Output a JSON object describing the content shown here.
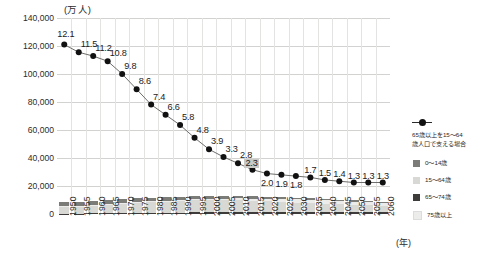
{
  "axis": {
    "unit_caption": "(万人)",
    "x_unit": "(年)",
    "y_ticks": [
      "140,000",
      "120,000",
      "100,000",
      "80,000",
      "60,000",
      "40,000",
      "20,000",
      "0"
    ]
  },
  "legend": {
    "series_label_line1": "65歳以上を15〜64",
    "series_label_line2": "歳人口で支える場合",
    "categories": [
      {
        "key": "c0014",
        "label": "0〜14歳",
        "color": "#7b7b78"
      },
      {
        "key": "c1564",
        "label": "15〜64歳",
        "color": "#d8d8d4"
      },
      {
        "key": "c6574",
        "label": "65〜74歳",
        "color": "#3d3c3a"
      },
      {
        "key": "c75up",
        "label": "75歳以上",
        "color": "#ececea"
      }
    ]
  },
  "chart_data": {
    "type": "bar",
    "title": "",
    "subtitle": "",
    "xlabel": "(年)",
    "ylabel": "(万人)",
    "ylim": [
      0,
      140000
    ],
    "y_ticks": [
      0,
      20000,
      40000,
      60000,
      80000,
      100000,
      120000,
      140000
    ],
    "grid": true,
    "legend_position": "right",
    "categories": [
      "1950",
      "1955",
      "1960",
      "1965",
      "1970",
      "1975",
      "1980",
      "1985",
      "1990",
      "1995",
      "2000",
      "2005",
      "2010",
      "2015",
      "2020",
      "2025",
      "2030",
      "2035",
      "2040",
      "2045",
      "2050",
      "2055",
      "2060"
    ],
    "series": [
      {
        "name": "65〜74歳",
        "color": "#3d3c3a",
        "values": [
          310,
          340,
          380,
          430,
          520,
          590,
          700,
          780,
          890,
          1110,
          1300,
          1410,
          1530,
          1750,
          1740,
          1480,
          1430,
          1520,
          1680,
          1580,
          1430,
          1380,
          1340
        ]
      },
      {
        "name": "15〜64歳",
        "color": "#d8d8d4",
        "values": [
          5000,
          5470,
          6000,
          6700,
          7210,
          7580,
          7880,
          8250,
          8590,
          8720,
          8620,
          8440,
          8170,
          7680,
          7400,
          7100,
          6770,
          6340,
          5790,
          5350,
          5080,
          4790,
          4420
        ]
      },
      {
        "name": "75歳以上",
        "color": "#ececea",
        "values": [
          110,
          130,
          160,
          190,
          220,
          280,
          370,
          470,
          600,
          720,
          900,
          1160,
          1420,
          1650,
          1880,
          2180,
          2280,
          2250,
          2240,
          2280,
          2420,
          2400,
          2340
        ]
      },
      {
        "name": "0〜14歳",
        "color": "#7b7b78",
        "values": [
          2980,
          2980,
          2840,
          2550,
          2520,
          2720,
          2750,
          2600,
          2250,
          2000,
          1850,
          1750,
          1680,
          1590,
          1460,
          1320,
          1200,
          1130,
          1070,
          1010,
          940,
          880,
          790
        ]
      }
    ],
    "totals": [
      8400,
      8920,
      9380,
      9870,
      10470,
      11170,
      11700,
      12100,
      12330,
      12550,
      12670,
      12760,
      12800,
      12670,
      12480,
      12080,
      11680,
      11240,
      10780,
      10220,
      9870,
      9450,
      8890
    ],
    "line_series": {
      "name": "65歳以上を15〜64歳人口で支える場合",
      "color": "#1b1b1b",
      "unit": "人",
      "values": [
        12.1,
        11.5,
        11.2,
        10.8,
        9.8,
        8.6,
        7.4,
        6.6,
        5.8,
        4.8,
        3.9,
        3.3,
        2.8,
        2.3,
        2.0,
        1.9,
        1.8,
        1.7,
        1.5,
        1.4,
        1.3,
        1.3,
        1.3
      ],
      "labels": [
        "12.1",
        "11.5",
        "11.2",
        "10.8",
        "9.8",
        "8.6",
        "7.4",
        "6.6",
        "5.8",
        "4.8",
        "3.9",
        "3.3",
        "2.8",
        "2.3",
        "2.0",
        "1.9",
        "1.8",
        "1.7",
        "1.5",
        "1.4",
        "1.3",
        "1.3",
        "1.3"
      ]
    }
  }
}
